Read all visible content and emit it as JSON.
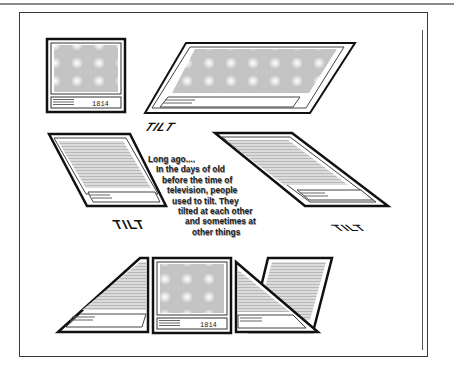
{
  "page": {
    "frame_color": "#3a3a3a",
    "screen_fill": "#d4d4d4"
  },
  "tv": {
    "channel_label": "1814"
  },
  "labels": {
    "tilt_top": "TILT",
    "tilt_left": "TILT",
    "tilt_right": "TILT"
  },
  "story": {
    "lines": [
      "Long ago....",
      "In the days of old",
      "before the time of",
      "television, people",
      "used to tilt. They",
      "tilted at each other",
      "and sometimes at",
      "other things"
    ]
  }
}
